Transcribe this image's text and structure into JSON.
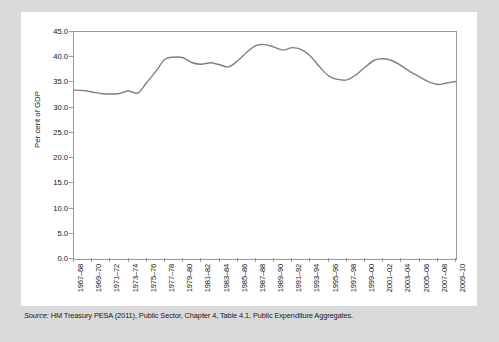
{
  "figure": {
    "source_label": "Source:",
    "source_text": " HM Treasury PESA (2011), Public Sector, Chapter 4, Table 4.1, Public Expenditure Aggregates."
  },
  "chart_data": {
    "type": "line",
    "title": "",
    "xlabel": "",
    "ylabel": "Per cent of GDP",
    "ylim": [
      0.0,
      45.0
    ],
    "yticks": [
      "0.0",
      "5.0",
      "10.0",
      "15.0",
      "20.0",
      "25.0",
      "30.0",
      "35.0",
      "40.0",
      "45.0"
    ],
    "ytick_values": [
      0.0,
      5.0,
      10.0,
      15.0,
      20.0,
      25.0,
      30.0,
      35.0,
      40.0,
      45.0
    ],
    "grid": false,
    "legend": "none",
    "line_color": "#808080",
    "axis_color": "#9a9a9a",
    "xtick_labels": [
      "1967–68",
      "1969–70",
      "1971–72",
      "1973–74",
      "1975–76",
      "1977–78",
      "1979–80",
      "1981–82",
      "1983–84",
      "1985–86",
      "1987–88",
      "1989–90",
      "1991–92",
      "1993–94",
      "1995–96",
      "1997–98",
      "1999–00",
      "2001–02",
      "2003–04",
      "2005–06",
      "2007–08",
      "2009–10"
    ],
    "x": [
      "1967–68",
      "1968–69",
      "1969–70",
      "1970–71",
      "1971–72",
      "1972–73",
      "1973–74",
      "1974–75",
      "1975–76",
      "1976–77",
      "1977–78",
      "1978–79",
      "1979–80",
      "1980–81",
      "1981–82",
      "1982–83",
      "1983–84",
      "1984–85",
      "1985–86",
      "1986–87",
      "1987–88",
      "1988–89",
      "1989–90",
      "1990–91",
      "1991–92",
      "1992–93",
      "1993–94",
      "1994–95",
      "1995–96",
      "1996–97",
      "1997–98",
      "1998–99",
      "1999–00",
      "2000–01",
      "2001–02",
      "2002–03",
      "2003–04",
      "2004–05",
      "2005–06",
      "2006–07",
      "2007–08",
      "2008–09",
      "2009–10"
    ],
    "values": [
      33.5,
      33.4,
      33.1,
      32.8,
      32.7,
      32.8,
      33.3,
      32.9,
      35.0,
      37.2,
      39.6,
      40.0,
      39.9,
      38.9,
      38.6,
      38.9,
      38.5,
      38.1,
      39.3,
      41.0,
      42.3,
      42.5,
      42.0,
      41.4,
      41.9,
      41.5,
      40.2,
      38.1,
      36.3,
      35.6,
      35.5,
      36.5,
      38.0,
      39.4,
      39.7,
      39.3,
      38.3,
      37.1,
      36.1,
      35.1,
      34.6,
      34.9,
      35.2
    ],
    "annotation_note": ""
  }
}
